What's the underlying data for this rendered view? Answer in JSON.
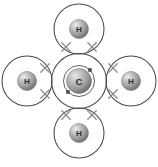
{
  "figure": {
    "type": "molecular-orbital-shell-diagram",
    "background_color": "#ffffff",
    "shell_stroke_color": "#4a4a4a",
    "electron_cross_color": "#8e8e8e",
    "electron_square_color": "#4f4f4f",
    "atom_sphere_light": "#e8e8e8",
    "atom_sphere_mid": "#a8a8a8",
    "atom_sphere_dark": "#6e6e6e",
    "label_color": "#2b2b2b"
  },
  "atoms": [
    {
      "id": "carbon-center",
      "symbol": "C",
      "role": "central-atom",
      "cx": 79,
      "cy": 81,
      "sphere_r": 12.5,
      "shells": [
        {
          "name": "inner-shell",
          "r": 15.5
        },
        {
          "name": "outer-shell",
          "r": 27.5
        }
      ]
    },
    {
      "id": "hydrogen-top",
      "symbol": "H",
      "role": "bonded-atom",
      "position": "top",
      "cx": 79,
      "cy": 29,
      "sphere_r": 9.5,
      "shells": [
        {
          "name": "shell",
          "r": 25
        }
      ]
    },
    {
      "id": "hydrogen-left",
      "symbol": "H",
      "role": "bonded-atom",
      "position": "left",
      "cx": 27,
      "cy": 81,
      "sphere_r": 9.5,
      "shells": [
        {
          "name": "shell",
          "r": 25
        }
      ]
    },
    {
      "id": "hydrogen-right",
      "symbol": "H",
      "role": "bonded-atom",
      "position": "right",
      "cx": 131,
      "cy": 81,
      "sphere_r": 9.5,
      "shells": [
        {
          "name": "shell",
          "r": 25
        }
      ]
    },
    {
      "id": "hydrogen-bottom",
      "symbol": "H",
      "role": "bonded-atom",
      "position": "bottom",
      "cx": 79,
      "cy": 133,
      "sphere_r": 9.5,
      "shells": [
        {
          "name": "shell",
          "r": 25
        }
      ]
    }
  ],
  "bond_electrons": [
    {
      "id": "bond-top-electron-left",
      "glyph": "x",
      "cx": 66,
      "cy": 47,
      "size": 4.2
    },
    {
      "id": "bond-top-electron-right",
      "glyph": "x",
      "cx": 92,
      "cy": 47,
      "size": 4.2
    },
    {
      "id": "bond-left-electron-top",
      "glyph": "x",
      "cx": 45,
      "cy": 68,
      "size": 4.2
    },
    {
      "id": "bond-left-electron-bottom",
      "glyph": "x",
      "cx": 45,
      "cy": 94,
      "size": 4.2
    },
    {
      "id": "bond-right-electron-top",
      "glyph": "x",
      "cx": 113,
      "cy": 68,
      "size": 4.2
    },
    {
      "id": "bond-right-electron-bottom",
      "glyph": "x",
      "cx": 113,
      "cy": 94,
      "size": 4.2
    },
    {
      "id": "bond-bottom-electron-left",
      "glyph": "x",
      "cx": 66,
      "cy": 115,
      "size": 4.2
    },
    {
      "id": "bond-bottom-electron-right",
      "glyph": "x",
      "cx": 92,
      "cy": 115,
      "size": 4.2
    }
  ],
  "inner_shell_electrons": [
    {
      "id": "carbon-inner-electron-upper-right",
      "glyph": "square",
      "cx": 90,
      "cy": 70,
      "size": 3.2
    },
    {
      "id": "carbon-inner-electron-lower-left",
      "glyph": "square",
      "cx": 68,
      "cy": 92,
      "size": 3.2
    }
  ]
}
